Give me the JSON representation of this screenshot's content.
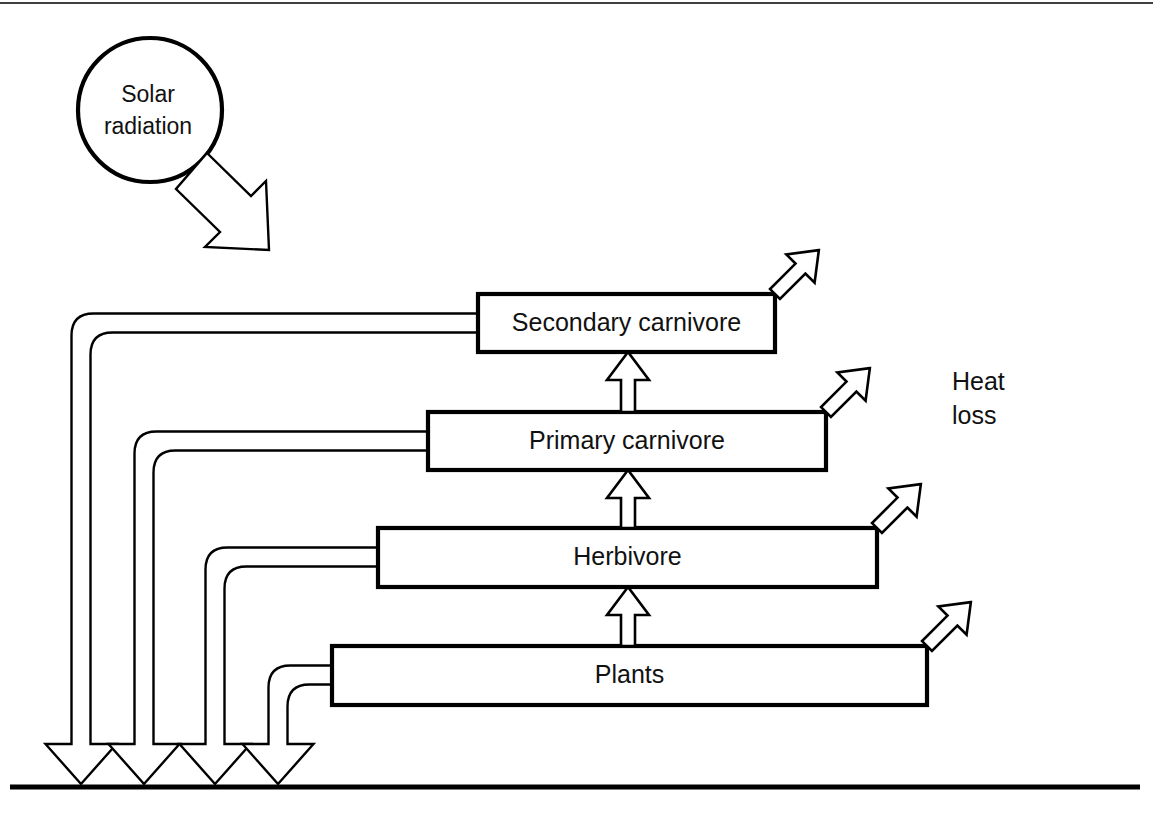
{
  "diagram": {
    "type": "flow-diagram",
    "background_color": "#ffffff",
    "line_color": "#000000",
    "source": {
      "label_line1": "Solar",
      "label_line2": "radiation",
      "shape": "circle",
      "cx": 150,
      "cy": 110,
      "r": 72
    },
    "heat_loss_label": {
      "line1": "Heat",
      "line2": "loss"
    },
    "trophic_levels": [
      {
        "id": "secondary-carnivore",
        "label": "Secondary carnivore",
        "x": 478,
        "y": 294,
        "width": 297,
        "height": 58,
        "level": 4
      },
      {
        "id": "primary-carnivore",
        "label": "Primary carnivore",
        "x": 428,
        "y": 412,
        "width": 398,
        "height": 58,
        "level": 3
      },
      {
        "id": "herbivore",
        "label": "Herbivore",
        "x": 378,
        "y": 528,
        "width": 499,
        "height": 59,
        "level": 2
      },
      {
        "id": "plants",
        "label": "Plants",
        "x": 332,
        "y": 646,
        "width": 595,
        "height": 59,
        "level": 1
      }
    ],
    "energy_transfer_arrows": [
      {
        "from": "plants",
        "to": "herbivore",
        "cx": 628,
        "y_top": 587,
        "y_bottom": 646
      },
      {
        "from": "herbivore",
        "to": "primary-carnivore",
        "cx": 628,
        "y_top": 470,
        "y_bottom": 528
      },
      {
        "from": "primary-carnivore",
        "to": "secondary-carnivore",
        "cx": 628,
        "y_top": 352,
        "y_bottom": 412
      }
    ],
    "heat_loss_arrows": [
      {
        "from": "secondary-carnivore",
        "x": 775,
        "y": 294
      },
      {
        "from": "primary-carnivore",
        "x": 826,
        "y": 412
      },
      {
        "from": "herbivore",
        "x": 877,
        "y": 528
      },
      {
        "from": "plants",
        "x": 927,
        "y": 646
      }
    ],
    "decomposer_pipes": [
      {
        "from": "secondary-carnivore",
        "box_x": 478,
        "box_mid_y": 323,
        "down_x": 81,
        "tip_y": 784
      },
      {
        "from": "primary-carnivore",
        "box_x": 428,
        "box_mid_y": 441,
        "down_x": 144,
        "tip_y": 784
      },
      {
        "from": "herbivore",
        "box_x": 378,
        "box_mid_y": 557,
        "down_x": 215,
        "tip_y": 784
      },
      {
        "from": "plants",
        "box_x": 332,
        "box_mid_y": 675,
        "down_x": 278,
        "tip_y": 784
      }
    ],
    "ground_line": {
      "x1": 10,
      "x2": 1140,
      "y": 787
    },
    "top_rule": {
      "x1": 0,
      "x2": 1153,
      "y": 3
    }
  }
}
